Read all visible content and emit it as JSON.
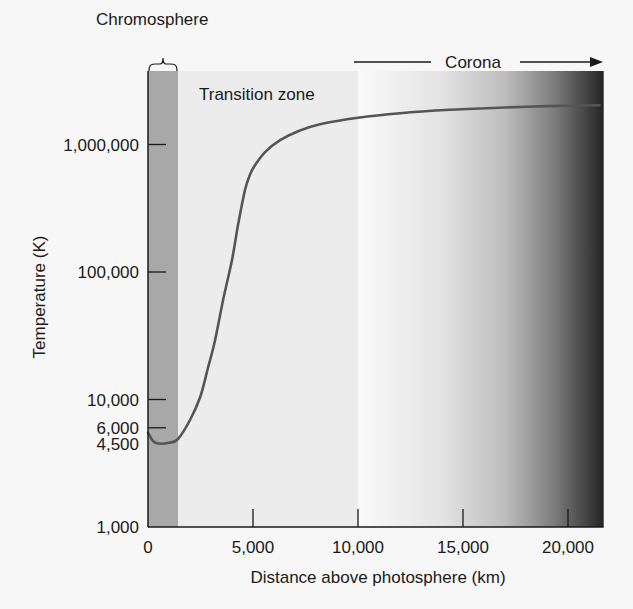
{
  "chart_data": {
    "type": "line",
    "title": "",
    "xlabel": "Distance above photosphere (km)",
    "ylabel": "Temperature (K)",
    "xscale": "linear",
    "yscale": "log",
    "xlim": [
      0,
      21700
    ],
    "ylim": [
      1000,
      2700000
    ],
    "grid": false,
    "x_ticks": [
      {
        "value": 0,
        "label": "0"
      },
      {
        "value": 5000,
        "label": "5,000"
      },
      {
        "value": 10000,
        "label": "10,000"
      },
      {
        "value": 15000,
        "label": "15,000"
      },
      {
        "value": 20000,
        "label": "20,000"
      }
    ],
    "y_ticks": [
      {
        "value": 1000,
        "label": "1,000"
      },
      {
        "value": 4500,
        "label": "4,500"
      },
      {
        "value": 6000,
        "label": "6,000"
      },
      {
        "value": 10000,
        "label": "10,000"
      },
      {
        "value": 100000,
        "label": "100,000"
      },
      {
        "value": 1000000,
        "label": "1,000,000"
      }
    ],
    "series": [
      {
        "name": "Temperature",
        "color": "#555555",
        "points": [
          [
            0,
            5500
          ],
          [
            250,
            4700
          ],
          [
            570,
            4500
          ],
          [
            1000,
            4580
          ],
          [
            1430,
            4900
          ],
          [
            2000,
            6900
          ],
          [
            2480,
            10400
          ],
          [
            2850,
            17500
          ],
          [
            3190,
            29000
          ],
          [
            3600,
            63000
          ],
          [
            4000,
            124000
          ],
          [
            4300,
            240000
          ],
          [
            4620,
            440000
          ],
          [
            4850,
            580000
          ],
          [
            5100,
            690000
          ],
          [
            5600,
            880000
          ],
          [
            6290,
            1080000
          ],
          [
            7200,
            1280000
          ],
          [
            8190,
            1440000
          ],
          [
            10000,
            1620000
          ],
          [
            12000,
            1760000
          ],
          [
            14380,
            1870000
          ],
          [
            17000,
            1950000
          ],
          [
            19000,
            2000000
          ],
          [
            21500,
            2030000
          ]
        ]
      }
    ],
    "regions": [
      {
        "name": "Chromosphere",
        "x_start": 0,
        "x_end": 1430,
        "color": "#a8a8a8"
      },
      {
        "name": "Transition zone",
        "x_start": 1430,
        "x_end": 10000,
        "color": "#ececec"
      },
      {
        "name": "Corona",
        "x_start": 10000,
        "x_end": 21700,
        "gradient": [
          "#fafafa",
          "#c9c9c9",
          "#8a8a8a",
          "#242424"
        ]
      }
    ],
    "annotations": [
      {
        "text": "Chromosphere",
        "type": "brace-label"
      },
      {
        "text": "Transition zone",
        "type": "label"
      },
      {
        "text": "Corona",
        "type": "arrow-label",
        "direction": "right"
      }
    ]
  },
  "labels": {
    "chromosphere": "Chromosphere",
    "transition_zone": "Transition zone",
    "corona": "Corona",
    "xlabel": "Distance above photosphere (km)",
    "ylabel": "Temperature (K)"
  }
}
